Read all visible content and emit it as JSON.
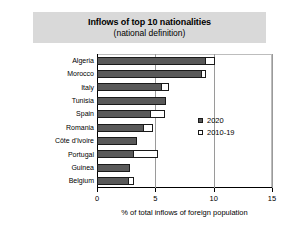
{
  "title": {
    "main": "Inflows of top 10 nationalities",
    "sub": "(national definition)"
  },
  "legend": {
    "position": "right-middle",
    "items": [
      {
        "label": "2020",
        "swatch": "filled-dark-square",
        "color": "#595959"
      },
      {
        "label": "2010-19",
        "swatch": "hollow-white-square",
        "color": "#ffffff"
      }
    ]
  },
  "axis": {
    "x_caption": "% of total inflows of foreign population",
    "x_ticks": [
      "0",
      "5",
      "10",
      "15"
    ]
  },
  "chart_data": {
    "type": "bar",
    "orientation": "horizontal",
    "stacked": true,
    "title": "Inflows of top 10 nationalities (national definition)",
    "xlabel": "% of total inflows of foreign population",
    "ylabel": "",
    "xlim": [
      0,
      15
    ],
    "xticks": [
      0,
      5,
      10,
      15
    ],
    "grid": "vertical-gridlines-at-5-10-15",
    "legend_position": "right",
    "categories": [
      "Algeria",
      "Morocco",
      "Italy",
      "Tunisia",
      "Spain",
      "Romania",
      "Côte d'Ivoire",
      "Portugal",
      "Guinea",
      "Belgium"
    ],
    "series": [
      {
        "name": "2020",
        "color": "#595959",
        "values": [
          9.3,
          9.0,
          5.6,
          5.9,
          4.6,
          4.0,
          3.4,
          3.2,
          2.8,
          2.7
        ]
      },
      {
        "name": "2010-19",
        "color": "#ffffff",
        "values": [
          0.8,
          0.3,
          0.6,
          0.0,
          1.2,
          0.8,
          0.0,
          2.0,
          0.0,
          0.5
        ]
      }
    ],
    "totals": [
      10.1,
      9.3,
      6.2,
      5.9,
      5.8,
      4.8,
      3.4,
      5.2,
      2.8,
      3.2
    ]
  },
  "colors": {
    "banner": "#d9d9d9",
    "bar_2020": "#595959",
    "bar_2010_19": "#ffffff",
    "outline": "#1a1a1a",
    "gridline": "#9a9a9a"
  }
}
